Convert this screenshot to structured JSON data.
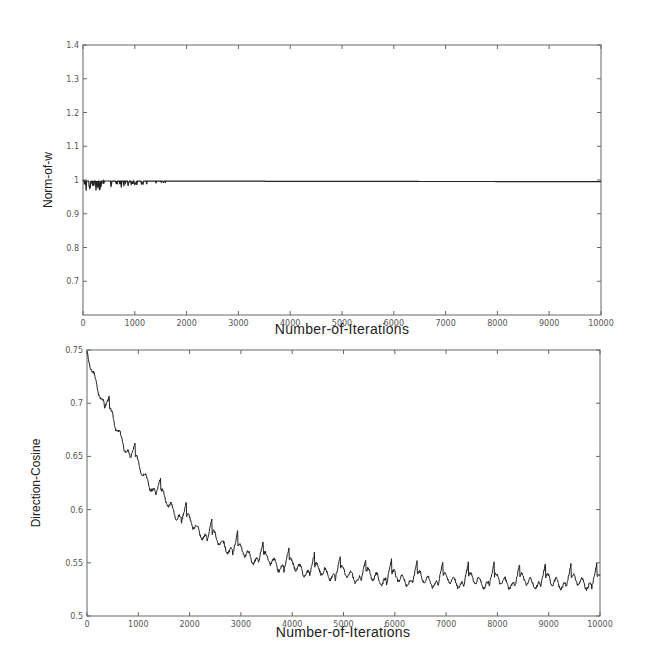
{
  "chart_data": [
    {
      "type": "line",
      "title": "",
      "xlabel": "Number-of-Iterations",
      "ylabel": "Norm-of-w",
      "xlim": [
        0,
        10000
      ],
      "ylim": [
        0.6,
        1.4
      ],
      "xticks": [
        0,
        1000,
        2000,
        3000,
        4000,
        5000,
        6000,
        7000,
        8000,
        9000,
        10000
      ],
      "yticks": [
        0.7,
        0.8,
        0.9,
        1,
        1.1,
        1.2,
        1.3,
        1.4
      ],
      "ytick_labels": [
        "0.7",
        "0.8",
        "0.9",
        "1",
        "1.1",
        "1.2",
        "1.3",
        "1.4"
      ],
      "grid": false,
      "series": [
        {
          "name": "Norm of w",
          "x": [
            0,
            50,
            100,
            200,
            300,
            500,
            1000,
            2000,
            5000,
            10000
          ],
          "values": [
            1.0,
            0.985,
            0.995,
            0.99,
            0.995,
            0.997,
            0.998,
            0.997,
            0.996,
            0.995
          ]
        }
      ],
      "notes": "Norm stays near 1 with small downward spikes in first ~1500 iterations."
    },
    {
      "type": "line",
      "title": "",
      "xlabel": "Number-of-Iterations",
      "ylabel": "Direction-Cosine",
      "xlim": [
        0,
        10000
      ],
      "ylim": [
        0.5,
        0.75
      ],
      "xticks": [
        0,
        1000,
        2000,
        3000,
        4000,
        5000,
        6000,
        7000,
        8000,
        9000,
        10000
      ],
      "yticks": [
        0.5,
        0.55,
        0.6,
        0.65,
        0.7,
        0.75
      ],
      "ytick_labels": [
        "0.5",
        "0.55",
        "0.6",
        "0.65",
        "0.7",
        "0.75"
      ],
      "grid": false,
      "series": [
        {
          "name": "Direction cosine",
          "x": [
            0,
            500,
            1000,
            1500,
            2000,
            2500,
            3000,
            3500,
            4000,
            4500,
            5000,
            6000,
            7000,
            8000,
            9000,
            10000
          ],
          "values": [
            0.748,
            0.705,
            0.665,
            0.635,
            0.61,
            0.59,
            0.575,
            0.565,
            0.555,
            0.548,
            0.545,
            0.542,
            0.54,
            0.54,
            0.54,
            0.54
          ]
        }
      ],
      "notes": "Exponential decay with sawtooth oscillation of period ~500 iterations, amplitude ~0.015."
    }
  ],
  "top": {
    "xlabel": "Number-of-Iterations",
    "ylabel": "Norm-of-w",
    "xtick_labels": [
      "0",
      "1000",
      "2000",
      "3000",
      "4000",
      "5000",
      "6000",
      "7000",
      "8000",
      "9000",
      "10000"
    ],
    "ytick_labels": [
      "0.7",
      "0.8",
      "0.9",
      "1",
      "1.1",
      "1.2",
      "1.3",
      "1.4"
    ]
  },
  "bottom": {
    "xlabel": "Number-of-Iterations",
    "ylabel": "Direction-Cosine",
    "xtick_labels": [
      "0",
      "1000",
      "2000",
      "3000",
      "4000",
      "5000",
      "6000",
      "7000",
      "8000",
      "9000",
      "10000"
    ],
    "ytick_labels": [
      "0.5",
      "0.55",
      "0.6",
      "0.65",
      "0.7",
      "0.75"
    ]
  }
}
